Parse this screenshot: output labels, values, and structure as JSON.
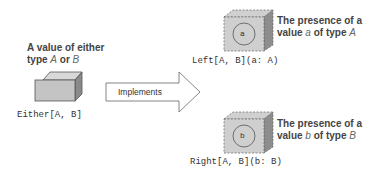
{
  "either": {
    "caption_line1": "A value of either",
    "caption_line2_prefix": "type ",
    "caption_type_a": "A",
    "caption_or": " or ",
    "caption_type_b": "B",
    "label": "Either[A, B]"
  },
  "arrow": {
    "label": "Implements"
  },
  "left": {
    "inner": "a",
    "label": "Left[A, B](a: A)",
    "desc_line1": "The presence of a",
    "desc_line2_prefix": "value ",
    "desc_var": "a",
    "desc_mid": " of type ",
    "desc_type": "A"
  },
  "right": {
    "inner": "b",
    "label": "Right[A, B](b: B)",
    "desc_line1": "The presence of a",
    "desc_line2_prefix": "value ",
    "desc_var": "b",
    "desc_mid": " of type ",
    "desc_type": "B"
  }
}
